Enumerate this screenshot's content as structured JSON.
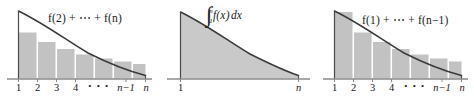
{
  "figure": {
    "background_color": "#ffffff",
    "fill_color": "#c9c9c9",
    "bar_fill_color": "#c2c2c2",
    "curve_color": "#3a3a3a",
    "axis_color": "#8a8a8a",
    "text_color": "#1a1a1a",
    "panel_count": 3
  },
  "panels": [
    {
      "id": "lower-sum",
      "label": "f(2) + ⋯ + f(n)",
      "label_parts": {
        "f": "f",
        "first_term": "f(2)",
        "ellipsis": "+ ⋯ +",
        "last_term": "f(n)"
      },
      "sum_type": "right-endpoint rectangles (inscribed, below curve)",
      "axis": {
        "ticks": [
          "1",
          "2",
          "3",
          "4",
          "⋯",
          "n−1",
          "n"
        ],
        "x_start": "1",
        "x_end": "n"
      },
      "bar_heights": [
        0.74,
        0.58,
        0.46,
        0.37,
        0.3,
        0.25,
        0.21
      ],
      "curve": "decreasing convex, f(x)=1/x-like"
    },
    {
      "id": "integral",
      "label": "∫ from 1 to n of f(x) dx",
      "label_parts": {
        "integral_sign": "∫",
        "lower_limit": "1",
        "upper_limit": "n",
        "integrand": "f(x)",
        "differential": "dx"
      },
      "sum_type": "area under curve",
      "axis": {
        "ticks": [
          "1",
          "n"
        ],
        "x_start": "1",
        "x_end": "n"
      },
      "curve": "decreasing convex, f(x)=1/x-like"
    },
    {
      "id": "upper-sum",
      "label": "f(1) + ⋯ + f(n−1)",
      "label_parts": {
        "f": "f",
        "first_term": "f(1)",
        "ellipsis": "+ ⋯ +",
        "last_term": "f(n−1)"
      },
      "sum_type": "left-endpoint rectangles (circumscribed, above curve)",
      "axis": {
        "ticks": [
          "1",
          "2",
          "3",
          "4",
          "⋯",
          "n−1",
          "n"
        ],
        "x_start": "1",
        "x_end": "n"
      },
      "bar_heights": [
        1.0,
        0.74,
        0.58,
        0.46,
        0.37,
        0.3,
        0.25
      ],
      "curve": "decreasing convex, f(x)=1/x-like"
    }
  ],
  "ticks": {
    "t1": "1",
    "t2": "2",
    "t3": "3",
    "t4": "4",
    "tdots": "• • •",
    "tn1": "n−1",
    "tn": "n"
  }
}
